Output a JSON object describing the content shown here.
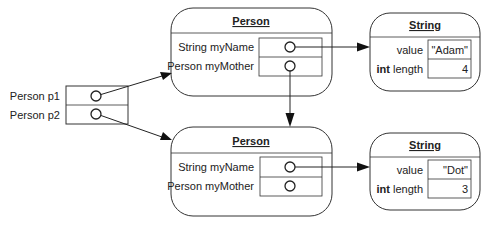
{
  "diagram": {
    "type": "object-reference-diagram",
    "variables": [
      {
        "label": "Person p1"
      },
      {
        "label": "Person p2"
      }
    ],
    "objects": [
      {
        "id": "person-1",
        "class_name": "Person",
        "fields": [
          {
            "label": "String myName",
            "value_type": "reference"
          },
          {
            "label": "Person myMother",
            "value_type": "reference"
          }
        ]
      },
      {
        "id": "person-2",
        "class_name": "Person",
        "fields": [
          {
            "label": "String myName",
            "value_type": "reference"
          },
          {
            "label": "Person myMother",
            "value_type": "reference"
          }
        ]
      },
      {
        "id": "string-1",
        "class_name": "String",
        "fields": [
          {
            "label_type": "",
            "label_name": "value",
            "value": "\"Adam\""
          },
          {
            "label_type": "int",
            "label_name": " length",
            "value": "4"
          }
        ]
      },
      {
        "id": "string-2",
        "class_name": "String",
        "fields": [
          {
            "label_type": "",
            "label_name": "value",
            "value": "\"Dot\""
          },
          {
            "label_type": "int",
            "label_name": " length",
            "value": "3"
          }
        ]
      }
    ],
    "references": [
      {
        "from": "Person p1",
        "to": "person-1"
      },
      {
        "from": "Person p2",
        "to": "person-2"
      },
      {
        "from": "person-1.myName",
        "to": "string-1"
      },
      {
        "from": "person-1.myMother",
        "to": "person-2"
      },
      {
        "from": "person-2.myName",
        "to": "string-2"
      },
      {
        "from": "person-2.myMother",
        "to": null
      }
    ]
  }
}
